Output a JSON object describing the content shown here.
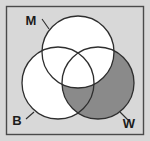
{
  "figure": {
    "name": "three-set-venn-diagram",
    "width": 150,
    "height": 141,
    "background_color": "#d8d8d8",
    "border_color": "#4a4a4a",
    "outline_color": "#2e2e2e"
  },
  "chart_data": {
    "type": "venn",
    "title": "",
    "subtitle": "",
    "xlabel": "",
    "ylabel": "",
    "grid": false,
    "legend_position": "inline-labels",
    "set_count": 3,
    "sets": [
      {
        "id": "M",
        "label": "M",
        "position": "top",
        "center_x": 78,
        "center_y": 52,
        "radius": 36,
        "fill": "#ffffff",
        "shaded": false,
        "label_x": 31,
        "label_y": 25,
        "leader_from_x": 42,
        "leader_from_y": 19,
        "leader_to_x": 49,
        "leader_to_y": 29
      },
      {
        "id": "B",
        "label": "B",
        "position": "bottom-left",
        "center_x": 58,
        "center_y": 83,
        "radius": 36,
        "fill": "#ffffff",
        "shaded": false,
        "label_x": 17,
        "label_y": 125,
        "leader_from_x": 26,
        "leader_from_y": 119,
        "leader_to_x": 34,
        "leader_to_y": 112
      },
      {
        "id": "W",
        "label": "W",
        "position": "bottom-right",
        "center_x": 98,
        "center_y": 83,
        "radius": 36,
        "fill": "#8a8a8a",
        "shaded": true,
        "label_x": 129,
        "label_y": 128,
        "leader_from_x": 128,
        "leader_from_y": 120,
        "leader_to_x": 120,
        "leader_to_y": 112
      }
    ],
    "regions": [
      {
        "id": "M-only",
        "sets": [
          "M"
        ],
        "fill": "#ffffff",
        "shaded": false
      },
      {
        "id": "B-only",
        "sets": [
          "B"
        ],
        "fill": "#ffffff",
        "shaded": false
      },
      {
        "id": "W-only",
        "sets": [
          "W"
        ],
        "fill": "#8a8a8a",
        "shaded": true
      },
      {
        "id": "M-and-B",
        "sets": [
          "M",
          "B"
        ],
        "fill": "#ffffff",
        "shaded": false
      },
      {
        "id": "M-and-W",
        "sets": [
          "M",
          "W"
        ],
        "fill": "#ffffff",
        "shaded": false
      },
      {
        "id": "B-and-W",
        "sets": [
          "B",
          "W"
        ],
        "fill": "#8a8a8a",
        "shaded": true
      },
      {
        "id": "M-and-B-and-W",
        "sets": [
          "M",
          "B",
          "W"
        ],
        "fill": "#ffffff",
        "shaded": false
      }
    ],
    "shaded_description": "Set W is shaded gray except where it is overlapped by set M"
  }
}
